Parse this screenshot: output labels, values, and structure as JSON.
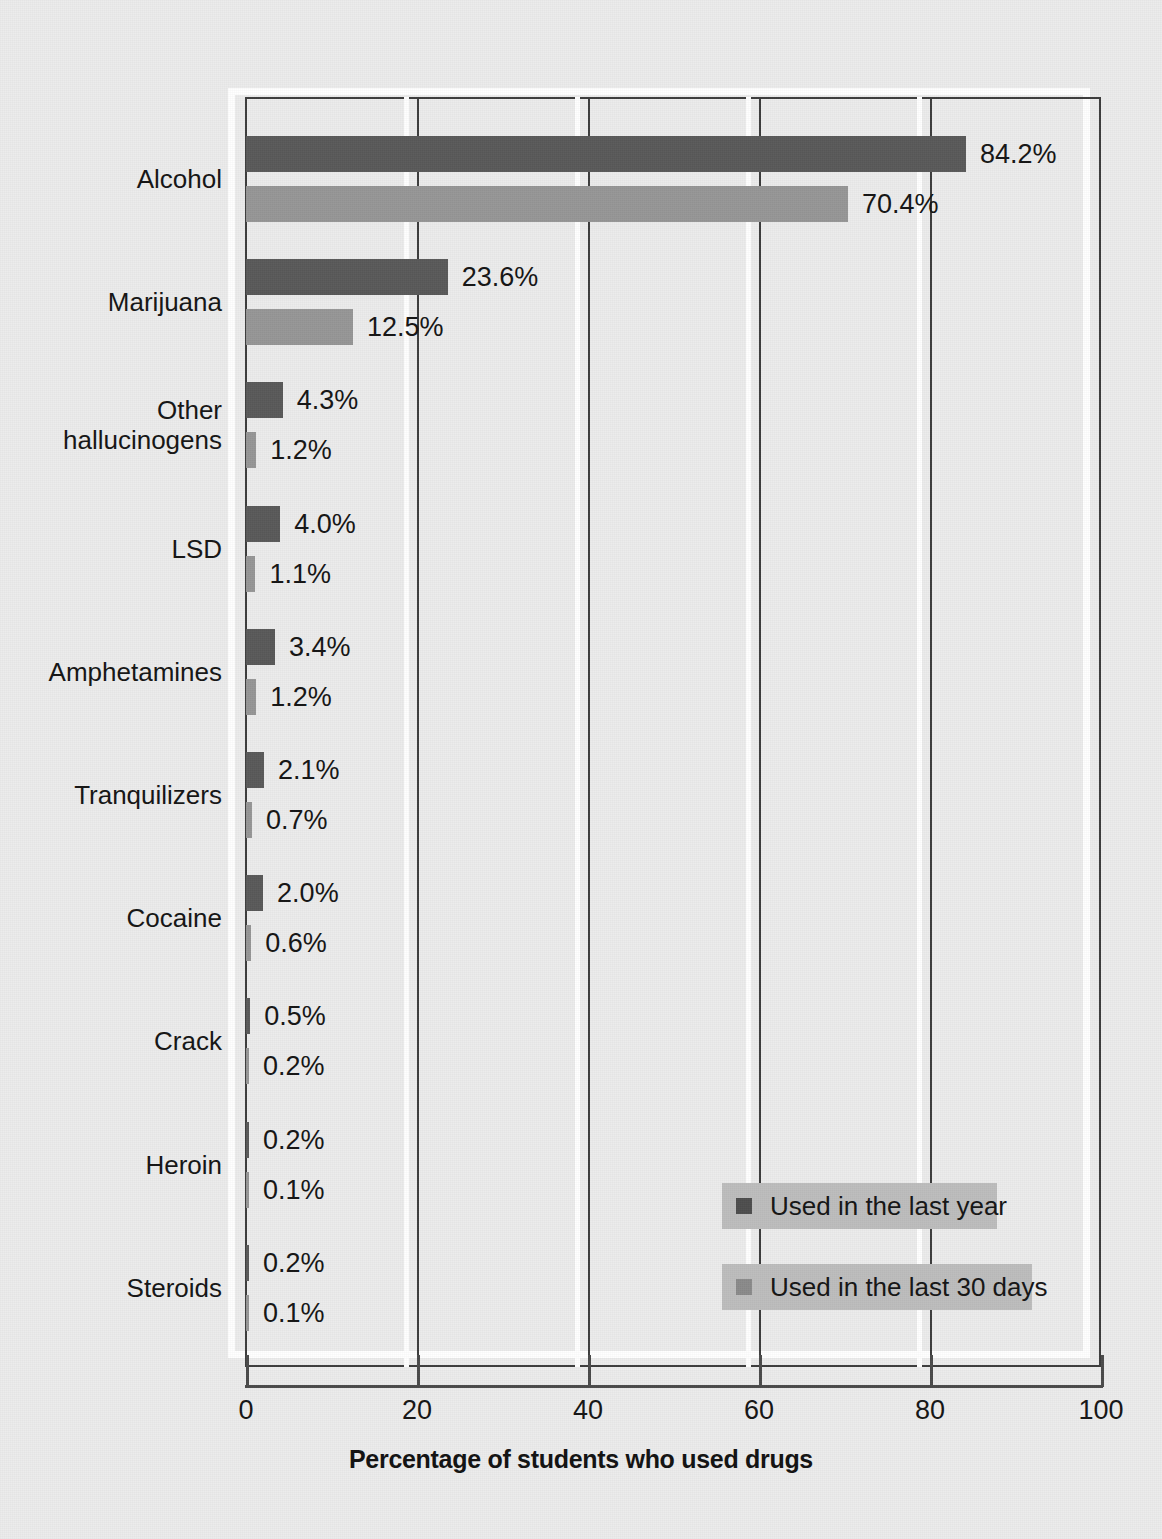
{
  "chart_data": {
    "type": "bar",
    "orientation": "horizontal",
    "title": "",
    "xlabel": "Percentage of students who used drugs",
    "ylabel": "",
    "xlim": [
      0,
      100
    ],
    "xticks": [
      "0",
      "20",
      "40",
      "60",
      "80",
      "100"
    ],
    "grid": true,
    "legend_position": "bottom-right",
    "categories": [
      "Alcohol",
      "Marijuana",
      "Other\nhallucinogens",
      "LSD",
      "Amphetamines",
      "Tranquilizers",
      "Cocaine",
      "Crack",
      "Heroin",
      "Steroids"
    ],
    "series": [
      {
        "name": "Used in the last year",
        "color": "#595959",
        "values": [
          84.2,
          23.6,
          4.3,
          4.0,
          3.4,
          2.1,
          2.0,
          0.5,
          0.2,
          0.2
        ],
        "labels": [
          "84.2%",
          "23.6%",
          "4.3%",
          "4.0%",
          "3.4%",
          "2.1%",
          "2.0%",
          "0.5%",
          "0.2%",
          "0.2%"
        ]
      },
      {
        "name": "Used in the last 30 days",
        "color": "#969696",
        "values": [
          70.4,
          12.5,
          1.2,
          1.1,
          1.2,
          0.7,
          0.6,
          0.2,
          0.1,
          0.1
        ],
        "labels": [
          "70.4%",
          "12.5%",
          "1.2%",
          "1.1%",
          "1.2%",
          "0.7%",
          "0.6%",
          "0.2%",
          "0.1%",
          "0.1%"
        ]
      }
    ]
  },
  "legend": {
    "items": [
      {
        "label": "Used in the last year",
        "swatch": "year"
      },
      {
        "label": "Used in the last 30 days",
        "swatch": "days"
      }
    ]
  },
  "colors": {
    "background": "#ececec",
    "series_year": "#595959",
    "series_30days": "#969696",
    "axis": "#3c3c3c",
    "legend_background": "#bdbdbd"
  }
}
